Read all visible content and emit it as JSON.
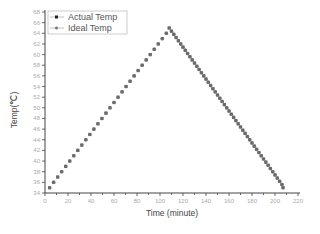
{
  "chart_data": {
    "type": "scatter",
    "title": "",
    "xlabel": "Time (minute)",
    "ylabel": "Temp(℃)",
    "xlim": [
      0,
      220
    ],
    "ylim": [
      34,
      68
    ],
    "xticks": [
      0,
      20,
      40,
      60,
      80,
      100,
      120,
      140,
      160,
      180,
      200,
      220
    ],
    "yticks": [
      34,
      36,
      38,
      40,
      42,
      44,
      46,
      48,
      50,
      52,
      54,
      56,
      58,
      60,
      62,
      64,
      66,
      68
    ],
    "grid": false,
    "legend_position": "upper-left",
    "peak": {
      "x": 108,
      "y": 65
    },
    "series": [
      {
        "name": "Actual Temp",
        "marker": "square",
        "color": "#333333",
        "x": [
          4,
          7.5,
          11,
          14.5,
          18,
          21.5,
          25,
          28.5,
          32,
          35.5,
          39,
          42.5,
          46,
          49.5,
          53,
          56.5,
          60,
          63.5,
          67,
          70.5,
          74,
          77.5,
          81,
          84.5,
          88,
          91.5,
          95,
          98.5,
          102,
          105.5,
          108,
          110,
          112,
          114,
          116,
          118,
          120,
          122,
          124,
          126,
          128,
          130,
          132,
          134,
          136,
          138,
          140,
          142,
          144,
          146,
          148,
          150,
          152,
          154,
          156,
          158,
          160,
          162,
          164,
          166,
          168,
          170,
          172,
          174,
          176,
          178,
          180,
          182,
          184,
          186,
          188,
          190,
          192,
          194,
          196,
          198,
          200,
          202,
          204,
          206,
          207
        ],
        "y": [
          35,
          36,
          37,
          38,
          39,
          40,
          41,
          42,
          43,
          44,
          45,
          46,
          47,
          48,
          49,
          50,
          51,
          52,
          53,
          54,
          55,
          56,
          57,
          58,
          59,
          60,
          61,
          62,
          63,
          64,
          65,
          64.4,
          63.8,
          63.2,
          62.6,
          62,
          61.4,
          60.8,
          60.2,
          59.6,
          59,
          58.4,
          57.8,
          57.2,
          56.6,
          56,
          55.4,
          54.8,
          54.2,
          53.6,
          53,
          52.4,
          51.8,
          51.2,
          50.6,
          50,
          49.4,
          48.8,
          48.2,
          47.6,
          47,
          46.4,
          45.8,
          45.2,
          44.6,
          44,
          43.4,
          42.8,
          42.2,
          41.6,
          41,
          40.4,
          39.8,
          39.2,
          38.6,
          38,
          37.4,
          36.8,
          36.2,
          35.6,
          35
        ]
      },
      {
        "name": "Ideal Temp",
        "marker": "circle",
        "color": "#888888",
        "x": [
          4,
          7.5,
          11,
          14.5,
          18,
          21.5,
          25,
          28.5,
          32,
          35.5,
          39,
          42.5,
          46,
          49.5,
          53,
          56.5,
          60,
          63.5,
          67,
          70.5,
          74,
          77.5,
          81,
          84.5,
          88,
          91.5,
          95,
          98.5,
          102,
          105.5,
          108,
          110,
          112,
          114,
          116,
          118,
          120,
          122,
          124,
          126,
          128,
          130,
          132,
          134,
          136,
          138,
          140,
          142,
          144,
          146,
          148,
          150,
          152,
          154,
          156,
          158,
          160,
          162,
          164,
          166,
          168,
          170,
          172,
          174,
          176,
          178,
          180,
          182,
          184,
          186,
          188,
          190,
          192,
          194,
          196,
          198,
          200,
          202,
          204,
          206,
          207
        ],
        "y": [
          35,
          36,
          37,
          38,
          39,
          40,
          41,
          42,
          43,
          44,
          45,
          46,
          47,
          48,
          49,
          50,
          51,
          52,
          53,
          54,
          55,
          56,
          57,
          58,
          59,
          60,
          61,
          62,
          63,
          64,
          65,
          64.4,
          63.8,
          63.2,
          62.6,
          62,
          61.4,
          60.8,
          60.2,
          59.6,
          59,
          58.4,
          57.8,
          57.2,
          56.6,
          56,
          55.4,
          54.8,
          54.2,
          53.6,
          53,
          52.4,
          51.8,
          51.2,
          50.6,
          50,
          49.4,
          48.8,
          48.2,
          47.6,
          47,
          46.4,
          45.8,
          45.2,
          44.6,
          44,
          43.4,
          42.8,
          42.2,
          41.6,
          41,
          40.4,
          39.8,
          39.2,
          38.6,
          38,
          37.4,
          36.8,
          36.2,
          35.6,
          35
        ]
      }
    ]
  },
  "legend": {
    "items": [
      {
        "label": "Actual Temp",
        "marker": "square"
      },
      {
        "label": "Ideal Temp",
        "marker": "circle"
      }
    ]
  },
  "axes": {
    "x_title": "Time (minute)",
    "y_title": "Temp(℃)"
  }
}
